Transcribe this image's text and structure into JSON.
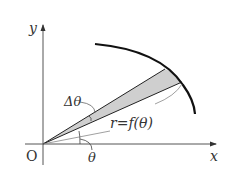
{
  "diagram": {
    "axes": {
      "x_label": "x",
      "y_label": "y",
      "origin_label": "O"
    },
    "labels": {
      "delta_theta": "Δθ",
      "curve": "r=f(θ)",
      "theta": "θ"
    },
    "colors": {
      "line": "#111111",
      "axis": "#444444",
      "wedge_fill": "#cfcfcf",
      "text": "#333333"
    }
  }
}
